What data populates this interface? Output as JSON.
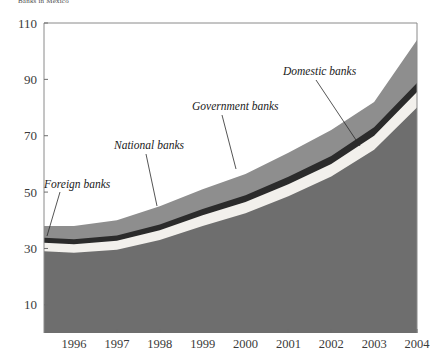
{
  "title": "Banks in Mexico",
  "chart_data": {
    "type": "area",
    "title": "Banks in Mexico",
    "subtitle": "",
    "xlabel": "",
    "ylabel": "",
    "stacked": true,
    "grid": false,
    "legend_position": "inline-annotations",
    "x": [
      1995.3,
      1996,
      1997,
      1998,
      1999,
      2000,
      2001,
      2002,
      2003,
      2004
    ],
    "xlim": [
      1995.3,
      2004
    ],
    "ylim": [
      0,
      110
    ],
    "yticks": [
      10,
      30,
      50,
      70,
      90,
      110
    ],
    "ytick_labels": [
      "10",
      "30",
      "50",
      "70",
      "90",
      "110"
    ],
    "xticks": [
      1996,
      1997,
      1998,
      1999,
      2000,
      2001,
      2002,
      2003,
      2004
    ],
    "xtick_labels": [
      "1996",
      "1997",
      "1998",
      "1999",
      "2000",
      "2001",
      "2002",
      "2003",
      "2004"
    ],
    "series": [
      {
        "name": "Domestic banks",
        "color": "#6e6e6e",
        "values": [
          29.0,
          28.5,
          29.5,
          33.0,
          38.0,
          42.5,
          48.5,
          55.5,
          65.0,
          80.0
        ]
      },
      {
        "name": "Foreign banks",
        "color": "#f2f0ec",
        "values": [
          3.0,
          3.0,
          3.2,
          3.5,
          3.8,
          4.0,
          4.3,
          4.5,
          5.0,
          5.5
        ]
      },
      {
        "name": "National banks",
        "color": "#2b2b2b",
        "values": [
          1.8,
          1.8,
          1.9,
          2.0,
          2.2,
          2.4,
          2.6,
          2.8,
          3.0,
          3.2
        ]
      },
      {
        "name": "Government banks",
        "color": "#8e8e8e",
        "values": [
          4.2,
          4.7,
          5.4,
          6.5,
          7.0,
          7.5,
          8.6,
          9.2,
          9.0,
          15.3
        ]
      }
    ],
    "series_totals_top": [
      38.0,
      38.0,
      40.0,
      45.0,
      51.0,
      56.4,
      64.0,
      72.0,
      82.0,
      104.0
    ],
    "annotations": [
      {
        "text": "Foreign banks",
        "label_x": 44,
        "label_y": 188,
        "leader": [
          [
            60,
            192
          ],
          [
            47,
            236
          ]
        ]
      },
      {
        "text": "National banks",
        "label_x": 114,
        "label_y": 149,
        "leader": [
          [
            146,
            154
          ],
          [
            157,
            206
          ]
        ]
      },
      {
        "text": "Government banks",
        "label_x": 192,
        "label_y": 110,
        "leader": [
          [
            222,
            115
          ],
          [
            236,
            169
          ]
        ]
      },
      {
        "text": "Domestic banks",
        "label_x": 283,
        "label_y": 75,
        "leader": [
          [
            316,
            80
          ],
          [
            360,
            146
          ]
        ]
      }
    ]
  },
  "axes": {
    "plot_left": 44,
    "plot_right": 417,
    "plot_top": 23,
    "plot_bottom": 333
  }
}
